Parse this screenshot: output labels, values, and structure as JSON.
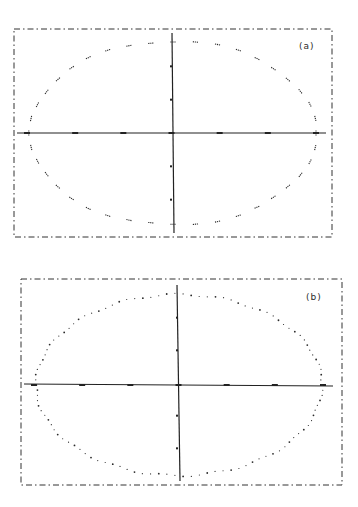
{
  "figure": {
    "panels": [
      {
        "id": "a",
        "label": "(a)"
      },
      {
        "id": "b",
        "label": "(b)"
      }
    ]
  },
  "colors": {
    "ink": "#2a2a2a",
    "background": "#ffffff"
  },
  "chart_data": [
    {
      "type": "scatter",
      "title": "",
      "panel_label": "(a)",
      "xlabel": "",
      "ylabel": "",
      "grid": false,
      "legend": "none",
      "description": "Points lying on an ellipse centered at origin; sparse dashed clusters",
      "x_ticks": 6,
      "y_ticks": 4,
      "ellipse": {
        "cx": 0,
        "cy": 0,
        "rx": 1.0,
        "ry": 0.65
      },
      "point_count": 40,
      "point_style": "short dashes"
    },
    {
      "type": "scatter",
      "title": "",
      "panel_label": "(b)",
      "xlabel": "",
      "ylabel": "",
      "grid": false,
      "legend": "none",
      "description": "Points lying on an ellipse centered at origin; denser dotted points",
      "x_ticks": 6,
      "y_ticks": 4,
      "ellipse": {
        "cx": 0,
        "cy": 0,
        "rx": 1.0,
        "ry": 0.64
      },
      "point_count": 110,
      "point_style": "dots"
    }
  ]
}
